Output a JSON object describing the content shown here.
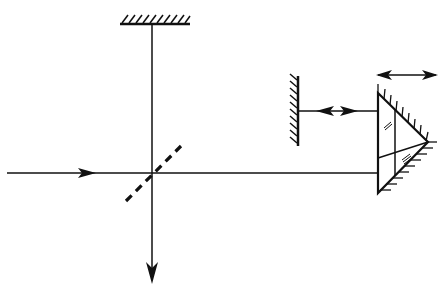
{
  "diagram": {
    "type": "optical-interferometer-schematic",
    "colors": {
      "line": "#111111",
      "background": "#ffffff"
    },
    "components": [
      {
        "id": "top-mirror",
        "kind": "fixed-mirror",
        "orientation": "horizontal"
      },
      {
        "id": "beam-splitter",
        "kind": "beam-splitter",
        "style": "dashed",
        "angle_deg": 45
      },
      {
        "id": "side-mirror",
        "kind": "fixed-mirror",
        "orientation": "vertical"
      },
      {
        "id": "corner-prism",
        "kind": "roof-prism-reflector"
      },
      {
        "id": "input-beam",
        "kind": "beam",
        "direction": "right"
      },
      {
        "id": "output-beam",
        "kind": "beam",
        "direction": "down"
      },
      {
        "id": "mirror-prism-distance",
        "kind": "double-arrow"
      },
      {
        "id": "prism-translation",
        "kind": "double-arrow"
      }
    ],
    "labels": []
  }
}
